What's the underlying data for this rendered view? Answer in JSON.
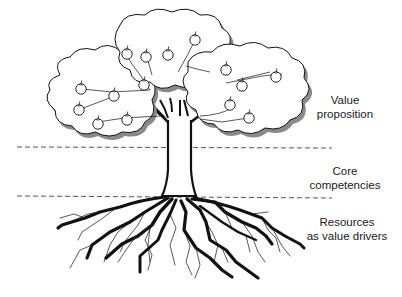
{
  "diagram": {
    "type": "tree-metaphor",
    "layers": [
      {
        "id": "crown",
        "lines": [
          "Value",
          "proposition"
        ]
      },
      {
        "id": "trunk",
        "lines": [
          "Core",
          "competencies"
        ]
      },
      {
        "id": "roots",
        "lines": [
          "Resources",
          "as value drivers"
        ]
      }
    ],
    "dividers": [
      {
        "y": 147,
        "style": "dashed"
      },
      {
        "y": 197,
        "style": "dashed"
      }
    ],
    "colors": {
      "stroke": "#111111",
      "fill": "#ffffff",
      "shadow": "#8a8a8a",
      "divider": "#555555",
      "text": "#1a1a1a"
    }
  }
}
